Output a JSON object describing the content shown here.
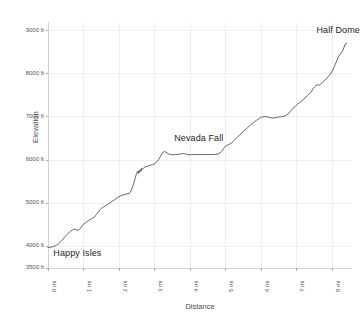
{
  "chart_data": {
    "type": "line",
    "title": "",
    "xlabel": "Distance",
    "ylabel": "Elevation",
    "xlim": [
      0,
      8.55
    ],
    "ylim": [
      3500,
      9200
    ],
    "grid": true,
    "legend": "none",
    "x_tick_labels": [
      "0 mi",
      "1 mi",
      "2 mi",
      "3 mi",
      "4 mi",
      "5 mi",
      "6 mi",
      "7 mi",
      "8 mi"
    ],
    "x_tick_values": [
      0,
      1,
      2,
      3,
      4,
      5,
      6,
      7,
      8
    ],
    "y_tick_labels": [
      "3500 ft",
      "4000 ft",
      "5000 ft",
      "6000 ft",
      "7000 ft",
      "8000 ft",
      "9000 ft"
    ],
    "y_tick_values": [
      3500,
      4000,
      5000,
      6000,
      7000,
      8000,
      9000
    ],
    "series": [
      {
        "name": "Trail elevation",
        "color": "#555555",
        "x": [
          0.0,
          0.06,
          0.12,
          0.18,
          0.24,
          0.3,
          0.36,
          0.42,
          0.48,
          0.54,
          0.6,
          0.64,
          0.68,
          0.72,
          0.76,
          0.8,
          0.84,
          0.88,
          0.92,
          0.96,
          1.0,
          1.06,
          1.12,
          1.18,
          1.24,
          1.3,
          1.34,
          1.38,
          1.42,
          1.46,
          1.5,
          1.56,
          1.62,
          1.68,
          1.74,
          1.8,
          1.86,
          1.92,
          1.98,
          2.04,
          2.1,
          2.16,
          2.22,
          2.28,
          2.34,
          2.38,
          2.42,
          2.46,
          2.48,
          2.5,
          2.52,
          2.54,
          2.56,
          2.58,
          2.6,
          2.62,
          2.64,
          2.66,
          2.7,
          2.76,
          2.82,
          2.88,
          2.94,
          3.0,
          3.06,
          3.12,
          3.16,
          3.2,
          3.24,
          3.28,
          3.32,
          3.38,
          3.44,
          3.5,
          3.58,
          3.66,
          3.72,
          3.78,
          3.84,
          3.9,
          3.96,
          4.04,
          4.12,
          4.2,
          4.3,
          4.4,
          4.5,
          4.6,
          4.7,
          4.78,
          4.84,
          4.88,
          4.92,
          4.96,
          5.0,
          5.06,
          5.12,
          5.18,
          5.24,
          5.3,
          5.38,
          5.46,
          5.54,
          5.62,
          5.7,
          5.78,
          5.86,
          5.94,
          6.0,
          6.06,
          6.12,
          6.18,
          6.24,
          6.3,
          6.36,
          6.42,
          6.48,
          6.54,
          6.6,
          6.66,
          6.72,
          6.78,
          6.84,
          6.9,
          6.96,
          7.02,
          7.08,
          7.14,
          7.2,
          7.26,
          7.32,
          7.38,
          7.42,
          7.46,
          7.5,
          7.54,
          7.58,
          7.62,
          7.66,
          7.7,
          7.76,
          7.82,
          7.88,
          7.94,
          8.0,
          8.04,
          8.08,
          8.12,
          8.16,
          8.2,
          8.24,
          8.28,
          8.32,
          8.36,
          8.4
        ],
        "y": [
          3975,
          3980,
          3990,
          4005,
          4030,
          4065,
          4110,
          4165,
          4225,
          4280,
          4330,
          4355,
          4380,
          4398,
          4402,
          4380,
          4372,
          4390,
          4430,
          4475,
          4520,
          4555,
          4590,
          4620,
          4650,
          4680,
          4720,
          4760,
          4800,
          4845,
          4880,
          4915,
          4945,
          4975,
          5005,
          5040,
          5075,
          5110,
          5145,
          5170,
          5190,
          5205,
          5215,
          5230,
          5290,
          5380,
          5490,
          5600,
          5660,
          5700,
          5745,
          5690,
          5760,
          5710,
          5790,
          5745,
          5815,
          5790,
          5830,
          5850,
          5865,
          5880,
          5895,
          5915,
          5960,
          6020,
          6080,
          6140,
          6185,
          6200,
          6180,
          6150,
          6130,
          6125,
          6128,
          6132,
          6140,
          6152,
          6148,
          6132,
          6125,
          6126,
          6128,
          6128,
          6128,
          6128,
          6128,
          6130,
          6132,
          6140,
          6165,
          6200,
          6245,
          6290,
          6330,
          6350,
          6375,
          6410,
          6455,
          6510,
          6575,
          6640,
          6700,
          6760,
          6815,
          6870,
          6920,
          6965,
          6995,
          7005,
          7008,
          7000,
          6985,
          6975,
          6978,
          6985,
          6998,
          7005,
          7010,
          7020,
          7050,
          7095,
          7150,
          7205,
          7255,
          7300,
          7335,
          7375,
          7420,
          7465,
          7510,
          7560,
          7610,
          7660,
          7700,
          7730,
          7745,
          7735,
          7750,
          7790,
          7835,
          7880,
          7930,
          7990,
          8070,
          8140,
          8220,
          8300,
          8380,
          8440,
          8480,
          8520,
          8600,
          8690,
          8710
        ]
      }
    ],
    "annotations": [
      {
        "id": "happy-isles",
        "label": "Happy Isles",
        "x": 0.15,
        "y": 3820
      },
      {
        "id": "nevada-fall",
        "label": "Nevada Fall",
        "x": 3.55,
        "y": 6480
      },
      {
        "id": "half-dome",
        "label": "Half Dome",
        "x": 7.55,
        "y": 8980
      }
    ]
  }
}
